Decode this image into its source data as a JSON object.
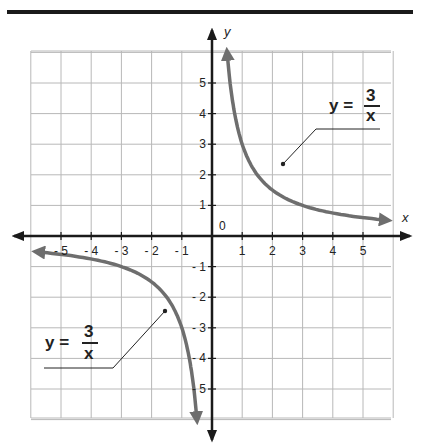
{
  "chart_data": {
    "type": "line",
    "title": "",
    "xlabel": "x",
    "ylabel": "y",
    "xlim": [
      -6,
      6
    ],
    "ylim": [
      -6,
      6
    ],
    "grid": true,
    "origin_label": "0",
    "x_ticks": [
      "-5",
      "-4",
      "-3",
      "-2",
      "-1",
      "1",
      "2",
      "3",
      "4",
      "5"
    ],
    "y_ticks": [
      "5",
      "4",
      "3",
      "2",
      "1",
      "-1",
      "-2",
      "-3",
      "-4",
      "-5"
    ],
    "series": [
      {
        "name": "y = 3/x (x > 0)",
        "function": "3/x",
        "x_range": [
          0.5,
          5.8
        ]
      },
      {
        "name": "y = 3/x (x < 0)",
        "function": "3/x",
        "x_range": [
          -5.8,
          -0.5
        ]
      }
    ],
    "annotations": [
      {
        "text": "y = 3/x",
        "numerator": "3",
        "denominator": "x",
        "points_to": [
          2.3,
          2.3
        ]
      },
      {
        "text": "y = 3/x",
        "numerator": "3",
        "denominator": "x",
        "points_to": [
          -1.6,
          -2.5
        ]
      }
    ]
  },
  "labels": {
    "x_axis": "x",
    "y_axis": "y",
    "origin": "0",
    "eq1_lhs": "y =",
    "eq1_num": "3",
    "eq1_den": "x",
    "eq2_lhs": "y =",
    "eq2_num": "3",
    "eq2_den": "x"
  },
  "colors": {
    "curve": "#6e6e6e",
    "axis": "#1a1a1a",
    "grid": "#b8b8b8"
  }
}
